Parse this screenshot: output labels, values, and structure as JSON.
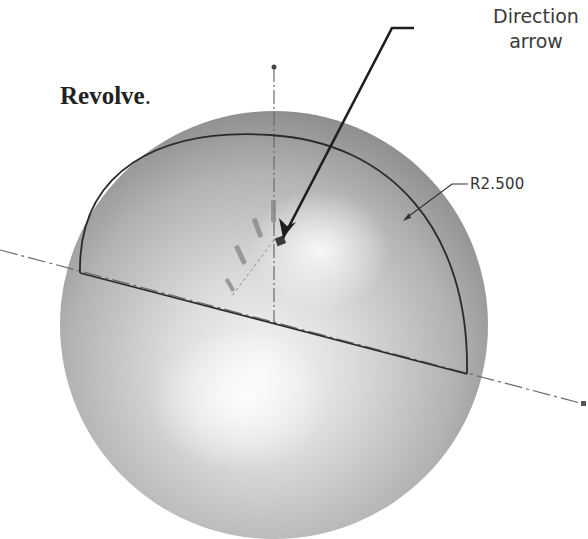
{
  "caption": {
    "text": "Revolve",
    "suffix": "."
  },
  "annotations": {
    "direction_arrow_label_line1": "Direction",
    "direction_arrow_label_line2": "arrow"
  },
  "dimension": {
    "radius_label": "R2.500"
  },
  "colors": {
    "sphere_light": "#f4f4f4",
    "sphere_mid": "#c8c8c8",
    "sphere_dark": "#8e8e8e",
    "sketch_line": "#2a2a2a",
    "centerline": "#666666"
  }
}
